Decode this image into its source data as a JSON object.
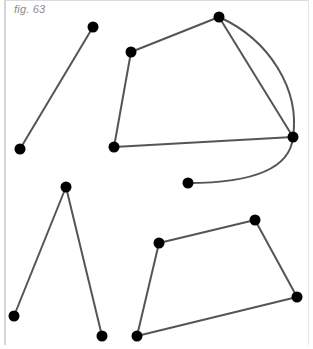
{
  "figure": {
    "label": "fig. 63",
    "colors": {
      "edge": "#555555",
      "node": "#000000",
      "background": "#ffffff"
    },
    "nodes": [
      {
        "id": "A",
        "x": 93,
        "y": 27
      },
      {
        "id": "B",
        "x": 20,
        "y": 149
      },
      {
        "id": "C",
        "x": 131,
        "y": 52
      },
      {
        "id": "D",
        "x": 219,
        "y": 17
      },
      {
        "id": "E",
        "x": 293,
        "y": 137
      },
      {
        "id": "F",
        "x": 114,
        "y": 147
      },
      {
        "id": "G",
        "x": 188,
        "y": 183
      },
      {
        "id": "H",
        "x": 66,
        "y": 187
      },
      {
        "id": "I",
        "x": 14,
        "y": 316
      },
      {
        "id": "J",
        "x": 102,
        "y": 336
      },
      {
        "id": "K",
        "x": 159,
        "y": 243
      },
      {
        "id": "L",
        "x": 255,
        "y": 220
      },
      {
        "id": "M",
        "x": 297,
        "y": 297
      },
      {
        "id": "N",
        "x": 137,
        "y": 336
      }
    ],
    "edges": [
      {
        "from": "A",
        "to": "B",
        "type": "straight"
      },
      {
        "from": "C",
        "to": "D",
        "type": "straight"
      },
      {
        "from": "D",
        "to": "E",
        "type": "straight"
      },
      {
        "from": "D",
        "to": "E",
        "type": "curved"
      },
      {
        "from": "E",
        "to": "F",
        "type": "straight"
      },
      {
        "from": "F",
        "to": "C",
        "type": "straight"
      },
      {
        "from": "E",
        "to": "G",
        "type": "curved"
      },
      {
        "from": "H",
        "to": "I",
        "type": "straight"
      },
      {
        "from": "H",
        "to": "J",
        "type": "straight"
      },
      {
        "from": "K",
        "to": "L",
        "type": "straight"
      },
      {
        "from": "L",
        "to": "M",
        "type": "straight"
      },
      {
        "from": "M",
        "to": "N",
        "type": "straight"
      },
      {
        "from": "N",
        "to": "K",
        "type": "straight"
      }
    ]
  }
}
